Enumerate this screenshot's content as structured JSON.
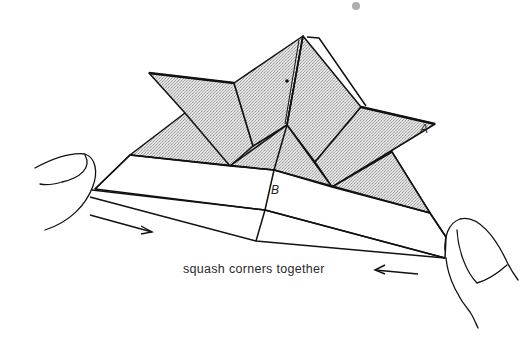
{
  "diagram": {
    "type": "origami-step-illustration",
    "caption": "squash corners together",
    "labels": {
      "point_a": "A",
      "point_b": "B"
    },
    "arrows": [
      {
        "name": "push-right-arrow",
        "direction": "right"
      },
      {
        "name": "push-left-arrow",
        "direction": "left"
      }
    ],
    "hands": [
      "left-thumb",
      "right-thumb"
    ],
    "colors": {
      "line": "#111111",
      "shaded_paper": "#d6d6d6",
      "background": "#ffffff"
    }
  }
}
